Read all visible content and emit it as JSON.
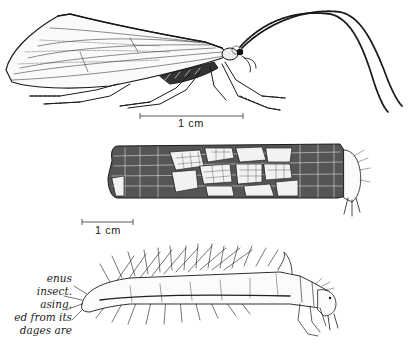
{
  "figure": {
    "subjects": [
      {
        "name": "adult-caddisfly",
        "description": "adult insect, side view, with long antennae"
      },
      {
        "name": "larval-case",
        "description": "cylindrical case made of plant fragments with larva emerging"
      },
      {
        "name": "larva",
        "description": "larva removed from its case, bristly body"
      }
    ],
    "scale_bars": [
      {
        "label": "1 cm",
        "x1": 140,
        "x2": 243,
        "y": 116
      },
      {
        "label": "1 cm",
        "x1": 82,
        "x2": 133,
        "y": 222
      }
    ],
    "caption_fragments": [
      "enus",
      "insect.",
      "asing.",
      "ed from its",
      "dages are"
    ]
  },
  "colors": {
    "ink": "#1a1a1a",
    "background": "#ffffff"
  }
}
